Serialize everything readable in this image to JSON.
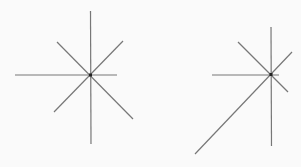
{
  "canvas": {
    "width": 301,
    "height": 167,
    "background": "#fafafa"
  },
  "colors": {
    "line": "#777777",
    "center": "#222222"
  },
  "figures": [
    {
      "name": "left-star",
      "center": [
        90.5,
        75
      ],
      "lines": [
        {
          "name": "vertical",
          "x1": 90.5,
          "y1": 11,
          "x2": 91,
          "y2": 144
        },
        {
          "name": "horizontal",
          "x1": 15,
          "y1": 75,
          "x2": 117,
          "y2": 75
        },
        {
          "name": "diagonal-ne-sw",
          "x1": 123,
          "y1": 41,
          "x2": 54,
          "y2": 112
        },
        {
          "name": "diagonal-nw-se",
          "x1": 57,
          "y1": 42,
          "x2": 133,
          "y2": 119
        }
      ]
    },
    {
      "name": "right-star",
      "center": [
        271,
        74.5
      ],
      "lines": [
        {
          "name": "vertical",
          "x1": 271,
          "y1": 27,
          "x2": 271.5,
          "y2": 146
        },
        {
          "name": "horizontal",
          "x1": 212,
          "y1": 75,
          "x2": 279,
          "y2": 75
        },
        {
          "name": "diagonal-nw-se",
          "x1": 238,
          "y1": 42,
          "x2": 288,
          "y2": 92
        },
        {
          "name": "diagonal-ne-sw",
          "x1": 292,
          "y1": 52,
          "x2": 195,
          "y2": 154
        }
      ]
    }
  ]
}
